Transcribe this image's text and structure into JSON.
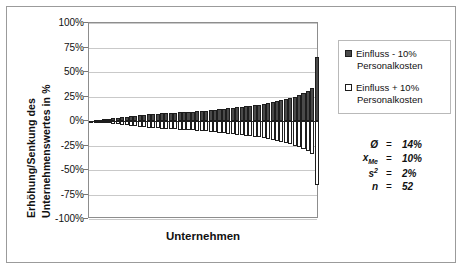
{
  "chart_data": {
    "type": "bar",
    "title": "",
    "xlabel": "Unternehmen",
    "ylabel": "Erhöhung/Senkung des Unternehmenswertes in %",
    "ylabel_line1": "Erhöhung/Senkung des",
    "ylabel_line2": "Unternehmenswertes in %",
    "ylim": [
      -100,
      100
    ],
    "ytick_labels": [
      "100%",
      "75%",
      "50%",
      "25%",
      "0%",
      "-25%",
      "-50%",
      "-75%",
      "-100%"
    ],
    "ytick_values": [
      100,
      75,
      50,
      25,
      0,
      -25,
      -50,
      -75,
      -100
    ],
    "grid": true,
    "legend_position": "right",
    "orientation": "vertical",
    "note": "Sorted back-to-back (tornado) bar chart: 52 companies, each with a positive dark bar and a mirrored negative white bar.",
    "categories": [
      "1",
      "2",
      "3",
      "4",
      "5",
      "6",
      "7",
      "8",
      "9",
      "10",
      "11",
      "12",
      "13",
      "14",
      "15",
      "16",
      "17",
      "18",
      "19",
      "20",
      "21",
      "22",
      "23",
      "24",
      "25",
      "26",
      "27",
      "28",
      "29",
      "30",
      "31",
      "32",
      "33",
      "34",
      "35",
      "36",
      "37",
      "38",
      "39",
      "40",
      "41",
      "42",
      "43",
      "44",
      "45",
      "46",
      "47",
      "48",
      "49",
      "50",
      "51",
      "52"
    ],
    "series": [
      {
        "name": "Einfluss - 10% Personalkosten",
        "color": "#4a4a4a",
        "values": [
          0.5,
          1,
          1.5,
          2,
          2.5,
          3,
          3.5,
          4,
          4.5,
          5,
          5.5,
          6,
          6.5,
          7,
          7.5,
          7.5,
          8,
          8,
          8.5,
          8.5,
          9,
          9,
          9.5,
          9.5,
          10,
          10,
          10.5,
          11,
          11.5,
          12,
          12.5,
          13,
          13.5,
          14,
          14.5,
          15,
          15.5,
          16,
          16.5,
          17,
          18,
          19,
          20,
          21,
          22,
          23,
          25,
          27,
          29,
          31,
          34,
          65
        ]
      },
      {
        "name": "Einfluss + 10% Personalkosten",
        "color": "#ffffff",
        "values": [
          -0.5,
          -1,
          -1.5,
          -2,
          -2.5,
          -3,
          -3.5,
          -4,
          -4.5,
          -5,
          -5.5,
          -6,
          -6.5,
          -7,
          -7.5,
          -7.5,
          -8,
          -8,
          -8.5,
          -8.5,
          -9,
          -9,
          -9.5,
          -9.5,
          -10,
          -10,
          -10.5,
          -11,
          -11.5,
          -12,
          -12.5,
          -13,
          -13.5,
          -14,
          -14.5,
          -15,
          -15.5,
          -16,
          -16.5,
          -17,
          -18,
          -19,
          -20,
          -21,
          -22,
          -23,
          -25,
          -27,
          -29,
          -31,
          -34,
          -65
        ]
      }
    ]
  },
  "legend": {
    "entries": [
      {
        "label_line1": "Einfluss - 10%",
        "label_line2": "Personalkosten",
        "swatch": "dark"
      },
      {
        "label_line1": "Einfluss + 10%",
        "label_line2": "Personalkosten",
        "swatch": "light"
      }
    ]
  },
  "stats": {
    "rows": [
      {
        "symbol": "Ø",
        "sub": "",
        "sup": "",
        "eq": "=",
        "value": "14%"
      },
      {
        "symbol": "x",
        "sub": "Me",
        "sup": "",
        "eq": "=",
        "value": "10%"
      },
      {
        "symbol": "s",
        "sub": "",
        "sup": "2",
        "eq": "=",
        "value": "2%"
      },
      {
        "symbol": "n",
        "sub": "",
        "sup": "",
        "eq": "=",
        "value": "52"
      }
    ]
  },
  "colors": {
    "bar_positive": "#4a4a4a",
    "bar_negative": "#ffffff",
    "bar_outline": "#1d1d1d",
    "grid": "#c9c9c9",
    "axis": "#8d8d8d",
    "frame": "#9b9b9b",
    "text": "#111111"
  }
}
